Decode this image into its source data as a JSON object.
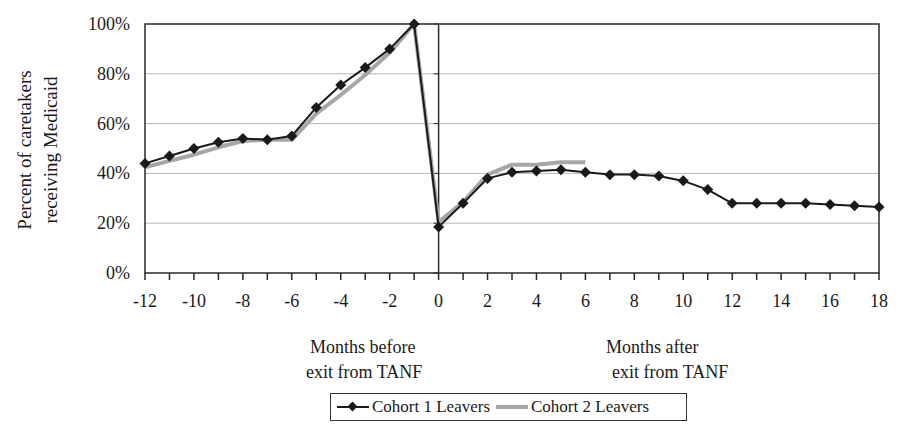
{
  "chart_data": {
    "type": "line",
    "title": "",
    "xlabel": "Months before exit from TANF / Months after exit from TANF",
    "ylabel": "Percent of caretakers receiving Medicaid",
    "ylim": [
      0,
      100
    ],
    "xlim": [
      -12,
      18
    ],
    "grid": true,
    "legend_position": "bottom",
    "y_ticks": [
      "0%",
      "20%",
      "40%",
      "60%",
      "80%",
      "100%"
    ],
    "x_ticks": [
      "-12",
      "-10",
      "-8",
      "-6",
      "-4",
      "-2",
      "0",
      "2",
      "4",
      "6",
      "8",
      "10",
      "12",
      "14",
      "16",
      "18"
    ],
    "x": [
      -12,
      -11,
      -10,
      -9,
      -8,
      -7,
      -6,
      -5,
      -4,
      -3,
      -2,
      -1,
      0,
      1,
      2,
      3,
      4,
      5,
      6,
      7,
      8,
      9,
      10,
      11,
      12,
      13,
      14,
      15,
      16,
      17,
      18
    ],
    "series": [
      {
        "name": "Cohort 1 Leavers",
        "color": "#1a1a1a",
        "marker": "diamond",
        "x": [
          -12,
          -11,
          -10,
          -9,
          -8,
          -7,
          -6,
          -5,
          -4,
          -3,
          -2,
          -1,
          0,
          1,
          2,
          3,
          4,
          5,
          6,
          7,
          8,
          9,
          10,
          11,
          12,
          13,
          14,
          15,
          16,
          17,
          18
        ],
        "values": [
          44,
          47,
          50,
          52.5,
          54,
          53.5,
          55,
          66.5,
          75.5,
          82.5,
          90,
          100,
          18.5,
          28,
          38,
          40.5,
          41,
          41.5,
          40.5,
          39.5,
          39.5,
          39,
          37,
          33.5,
          28,
          28,
          28,
          28,
          27.5,
          27,
          26.5
        ]
      },
      {
        "name": "Cohort 2 Leavers",
        "color": "#a6a6a6",
        "marker": "none",
        "x": [
          -12,
          -11,
          -10,
          -9,
          -8,
          -7,
          -6,
          -5,
          -4,
          -3,
          -2,
          -1,
          0,
          1,
          2,
          3,
          4,
          5,
          6
        ],
        "values": [
          42.5,
          45,
          47.5,
          50.5,
          53,
          53.5,
          53.5,
          64,
          71.5,
          79.5,
          88.5,
          100,
          20.5,
          28.5,
          39.5,
          43.5,
          43.5,
          44.5,
          44.5
        ]
      }
    ],
    "annotations": [
      "Months before exit from TANF",
      "Months after exit from TANF"
    ]
  },
  "labels": {
    "ylabel_line1": "Percent of  caretakers",
    "ylabel_line2": "receiving Medicaid",
    "before_line1": "Months before",
    "before_line2": "exit from TANF",
    "after_line1": "Months after",
    "after_line2": "exit from TANF",
    "legend_c1": "Cohort 1 Leavers",
    "legend_c2": "Cohort 2 Leavers"
  }
}
